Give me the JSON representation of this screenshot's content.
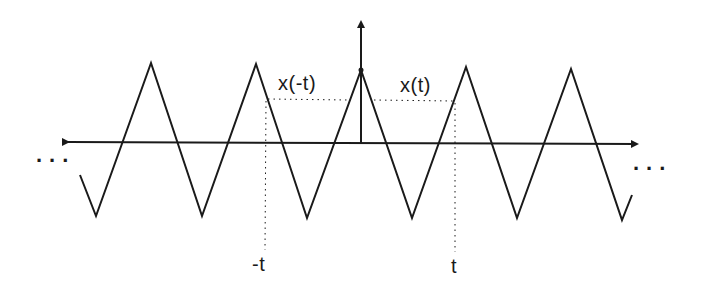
{
  "diagram": {
    "labels": {
      "x_neg_t": "x(-t)",
      "x_t": "x(t)",
      "neg_t": "-t",
      "t": "t",
      "ellipsis_left": "...",
      "ellipsis_right": "..."
    },
    "waveform": {
      "type": "triangle",
      "symmetry": "even",
      "points": [
        [
          80,
          175
        ],
        [
          96,
          216
        ],
        [
          151,
          63
        ],
        [
          202,
          216
        ],
        [
          256,
          64
        ],
        [
          307,
          218
        ],
        [
          361,
          70
        ],
        [
          412,
          218
        ],
        [
          466,
          67
        ],
        [
          517,
          218
        ],
        [
          571,
          69
        ],
        [
          622,
          220
        ],
        [
          632,
          195
        ]
      ]
    },
    "axes": {
      "horizontal": {
        "x1": 64,
        "x2": 641,
        "y": 142,
        "arrows": "both"
      },
      "vertical": {
        "x": 361,
        "y1": 144,
        "y2": 18,
        "arrow": "up"
      }
    },
    "guides": {
      "neg_t_x": 266,
      "t_x": 455,
      "level_y": 99
    },
    "colors": {
      "ink": "#1a1a1a",
      "background": "#ffffff"
    }
  }
}
